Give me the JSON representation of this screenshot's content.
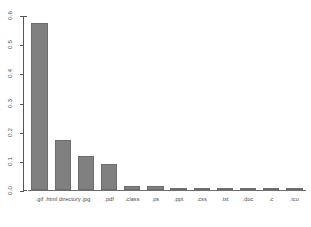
{
  "chart_data": {
    "type": "bar",
    "title": "",
    "subtitle": "",
    "xlabel": "",
    "ylabel": "",
    "grid": false,
    "legend": false,
    "legend_position": "none",
    "orientation": "vertical",
    "bar_color": "#808080",
    "bar_border_color": "#6d6d6d",
    "axis_color": "#555555",
    "background_color": "#ffffff",
    "categories": [
      ".gif",
      ".html directory",
      ".jpg",
      ".pdf",
      ".class",
      ".ps",
      ".ppt",
      ".css",
      ".txt",
      ".doc",
      ".c",
      ".ico"
    ],
    "values": [
      0.573,
      0.172,
      0.117,
      0.09,
      0.013,
      0.013,
      0.003,
      0.002,
      0.002,
      0.002,
      0.001,
      0.001
    ],
    "ylim": [
      0,
      0.6
    ],
    "xlim": [
      0,
      12
    ],
    "yticks": [
      0.0,
      0.1,
      0.2,
      0.3,
      0.4,
      0.5,
      0.6
    ],
    "ytick_labels": [
      "0.0",
      "0.1",
      "0.2",
      "0.3",
      "0.4",
      "0.5",
      "0.6"
    ],
    "ytick_label_rotation": -90,
    "xtick_labels": [
      ".gif",
      ".html directory",
      ".jpg",
      ".pdf",
      ".class",
      ".ps",
      ".ppt",
      ".css",
      ".txt",
      ".doc",
      ".c",
      ".ico"
    ],
    "annotations": []
  }
}
